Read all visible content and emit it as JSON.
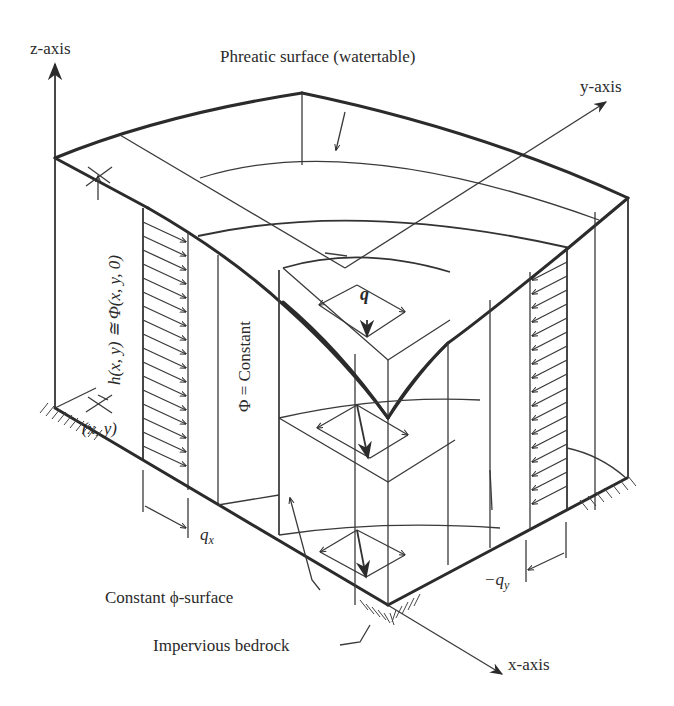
{
  "figure": {
    "axes": {
      "z_label": "z-axis",
      "y_label": "y-axis",
      "x_label": "x-axis"
    },
    "labels": {
      "phreatic_surface": "Phreatic surface (watertable)",
      "head_equation": "h(x, y) ≅ Φ(x, y, 0)",
      "point": "(x, y)",
      "phi_constant": "Φ = Constant",
      "flux_vector": "q",
      "flux_x": "q",
      "flux_x_sub": "x",
      "flux_y": "−q",
      "flux_y_sub": "y",
      "constant_phi_surface": "Constant ϕ-surface",
      "impervious_bedrock": "Impervious bedrock"
    },
    "colors": {
      "line": "#2b2b2b",
      "text": "#2a2a2a",
      "background": "#ffffff"
    }
  }
}
